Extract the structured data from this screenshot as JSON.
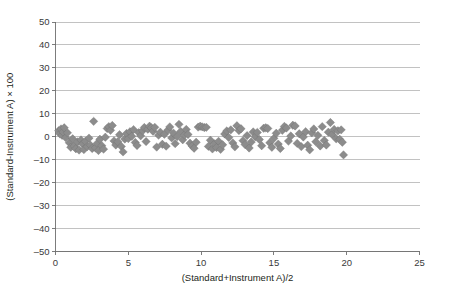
{
  "chart_data": {
    "type": "scatter",
    "title": "",
    "xlabel": "(Standard+Instrument A)/2",
    "ylabel": "(Standard-Instrument A) × 100",
    "xlim": [
      0,
      25
    ],
    "ylim": [
      -50,
      50
    ],
    "xticks": [
      0,
      5,
      10,
      15,
      20,
      25
    ],
    "yticks": [
      50,
      40,
      30,
      20,
      10,
      0,
      -10,
      -20,
      -30,
      -40,
      -50
    ],
    "xtick_labels": [
      "0",
      "5",
      "10",
      "15",
      "20",
      "25"
    ],
    "ytick_labels": [
      "50",
      "40",
      "30",
      "20",
      "10",
      "0",
      "–10",
      "–20",
      "–30",
      "–40",
      "–50"
    ],
    "grid": "horizontal",
    "legend": "none",
    "marker": "diamond",
    "marker_color": "#8c8c8c",
    "marker_size": 4.2,
    "series": [
      {
        "name": "Standard vs Instrument A difference",
        "points": [
          [
            0.22,
            2.6
          ],
          [
            0.3,
            1.3
          ],
          [
            0.38,
            3.4
          ],
          [
            0.45,
            0.6
          ],
          [
            0.52,
            2.1
          ],
          [
            0.6,
            3.9
          ],
          [
            0.7,
            -0.4
          ],
          [
            0.82,
            1.7
          ],
          [
            0.95,
            -2.6
          ],
          [
            1.05,
            -4.6
          ],
          [
            1.18,
            -0.9
          ],
          [
            1.28,
            -4.1
          ],
          [
            1.4,
            -5.2
          ],
          [
            1.52,
            -2.3
          ],
          [
            1.62,
            -5.8
          ],
          [
            1.75,
            -1.4
          ],
          [
            1.86,
            -3.2
          ],
          [
            1.95,
            -5.6
          ],
          [
            2.05,
            -2.0
          ],
          [
            2.18,
            -4.3
          ],
          [
            2.3,
            -0.6
          ],
          [
            2.4,
            -3.7
          ],
          [
            2.52,
            -5.1
          ],
          [
            2.62,
            6.7
          ],
          [
            2.74,
            -4.8
          ],
          [
            2.86,
            -2.9
          ],
          [
            2.95,
            -6.0
          ],
          [
            3.05,
            -1.1
          ],
          [
            3.18,
            -3.9
          ],
          [
            3.3,
            -5.4
          ],
          [
            3.42,
            -0.2
          ],
          [
            3.55,
            3.6
          ],
          [
            3.66,
            4.4
          ],
          [
            3.78,
            2.8
          ],
          [
            3.9,
            4.9
          ],
          [
            4.02,
            -1.8
          ],
          [
            4.14,
            -3.6
          ],
          [
            4.28,
            -2.2
          ],
          [
            4.4,
            0.9
          ],
          [
            4.52,
            -4.2
          ],
          [
            4.64,
            -6.6
          ],
          [
            4.76,
            -1.0
          ],
          [
            4.88,
            1.4
          ],
          [
            5.0,
            -0.8
          ],
          [
            5.12,
            2.2
          ],
          [
            5.24,
            0.2
          ],
          [
            5.36,
            3.1
          ],
          [
            5.48,
            -2.5
          ],
          [
            5.6,
            -3.8
          ],
          [
            5.72,
            1.8
          ],
          [
            5.85,
            0.4
          ],
          [
            5.98,
            2.6
          ],
          [
            6.1,
            4.0
          ],
          [
            6.22,
            -2.1
          ],
          [
            6.34,
            3.3
          ],
          [
            6.46,
            4.6
          ],
          [
            6.58,
            3.9
          ],
          [
            6.7,
            2.4
          ],
          [
            6.82,
            4.1
          ],
          [
            6.95,
            -4.5
          ],
          [
            7.08,
            0.7
          ],
          [
            7.2,
            2.0
          ],
          [
            7.34,
            -3.3
          ],
          [
            7.48,
            1.1
          ],
          [
            7.6,
            -4.1
          ],
          [
            7.72,
            2.9
          ],
          [
            7.85,
            4.3
          ],
          [
            7.98,
            -0.5
          ],
          [
            8.1,
            1.6
          ],
          [
            8.22,
            -3.0
          ],
          [
            8.36,
            0.1
          ],
          [
            8.48,
            5.4
          ],
          [
            8.6,
            2.3
          ],
          [
            8.74,
            -1.3
          ],
          [
            8.86,
            0.8
          ],
          [
            8.98,
            3.2
          ],
          [
            9.1,
            1.0
          ],
          [
            9.24,
            -2.8
          ],
          [
            9.38,
            -4.0
          ],
          [
            9.52,
            -5.0
          ],
          [
            9.66,
            -2.4
          ],
          [
            9.8,
            4.2
          ],
          [
            9.94,
            4.6
          ],
          [
            10.08,
            4.3
          ],
          [
            10.22,
            4.0
          ],
          [
            10.36,
            4.1
          ],
          [
            10.5,
            -4.2
          ],
          [
            10.64,
            -1.5
          ],
          [
            10.78,
            -5.3
          ],
          [
            10.92,
            -3.1
          ],
          [
            11.06,
            -4.7
          ],
          [
            11.2,
            -2.0
          ],
          [
            11.34,
            -5.5
          ],
          [
            11.48,
            -3.5
          ],
          [
            11.62,
            1.2
          ],
          [
            11.76,
            2.5
          ],
          [
            11.9,
            -0.3
          ],
          [
            12.04,
            3.0
          ],
          [
            12.18,
            -2.7
          ],
          [
            12.32,
            -4.4
          ],
          [
            12.46,
            4.8
          ],
          [
            12.6,
            2.7
          ],
          [
            12.74,
            3.5
          ],
          [
            12.88,
            -1.7
          ],
          [
            13.02,
            -3.4
          ],
          [
            13.16,
            0.5
          ],
          [
            13.3,
            -4.9
          ],
          [
            13.44,
            -2.3
          ],
          [
            13.58,
            2.1
          ],
          [
            13.72,
            0.0
          ],
          [
            13.86,
            1.9
          ],
          [
            14.0,
            -1.2
          ],
          [
            14.16,
            -3.9
          ],
          [
            14.3,
            3.7
          ],
          [
            14.44,
            3.9
          ],
          [
            14.58,
            3.6
          ],
          [
            14.72,
            -2.6
          ],
          [
            14.86,
            -4.6
          ],
          [
            15.0,
            -0.7
          ],
          [
            15.16,
            1.5
          ],
          [
            15.3,
            -3.2
          ],
          [
            15.44,
            -5.1
          ],
          [
            15.58,
            2.8
          ],
          [
            15.72,
            4.5
          ],
          [
            15.86,
            3.8
          ],
          [
            16.0,
            -1.9
          ],
          [
            16.16,
            0.3
          ],
          [
            16.3,
            5.0
          ],
          [
            16.46,
            4.7
          ],
          [
            16.6,
            -2.9
          ],
          [
            16.74,
            1.3
          ],
          [
            16.88,
            -4.3
          ],
          [
            17.02,
            -0.1
          ],
          [
            17.18,
            2.2
          ],
          [
            17.32,
            -3.7
          ],
          [
            17.46,
            -5.7
          ],
          [
            17.6,
            1.7
          ],
          [
            17.74,
            3.4
          ],
          [
            17.88,
            -2.2
          ],
          [
            18.02,
            0.6
          ],
          [
            18.18,
            -4.0
          ],
          [
            18.32,
            4.4
          ],
          [
            18.46,
            -1.6
          ],
          [
            18.6,
            -3.6
          ],
          [
            18.74,
            2.0
          ],
          [
            18.88,
            6.2
          ],
          [
            19.0,
            1.0
          ],
          [
            19.14,
            3.2
          ],
          [
            19.28,
            -0.9
          ],
          [
            19.4,
            2.6
          ],
          [
            19.52,
            -1.1
          ],
          [
            19.62,
            3.0
          ],
          [
            19.7,
            -2.4
          ],
          [
            19.78,
            -7.9
          ]
        ]
      }
    ]
  }
}
